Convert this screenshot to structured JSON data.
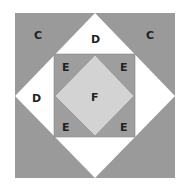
{
  "diagram": {
    "colors": {
      "background": "#ffffff",
      "outer_square": "#9a9a9a",
      "diamond_d": "#ffffff",
      "inner_square_e": "#9e9e9e",
      "center_diamond_f": "#d3d3d3",
      "edge": "#888888"
    },
    "labels": {
      "c_left": "C",
      "c_right": "C",
      "d_top": "D",
      "d_left": "D",
      "e_tl": "E",
      "e_tr": "E",
      "e_bl": "E",
      "e_br": "E",
      "f_center": "F"
    }
  }
}
